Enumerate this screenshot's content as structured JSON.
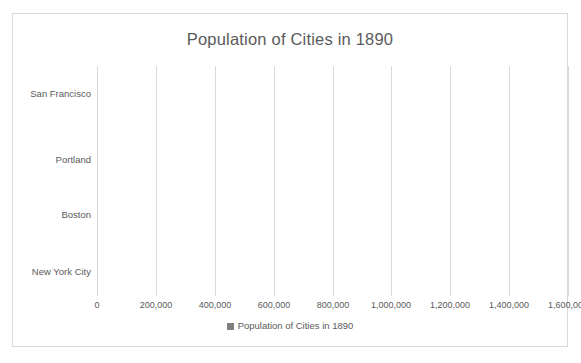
{
  "page": {
    "scan_artifact_text": "​"
  },
  "chart": {
    "title": "Population of Cities in 1890",
    "legend_label": "Population of Cities in 1890",
    "legend_swatch_name": "legend-color-swatch",
    "bar_color": "#808080",
    "gridline_color": "#d9d9d9",
    "text_color": "#5a5a5a",
    "frame_color": "#d9d9d9"
  },
  "chart_data": {
    "type": "bar",
    "orientation": "horizontal",
    "title": "Population of Cities in 1890",
    "xlabel": "",
    "ylabel": "",
    "categories": [
      "San Francisco",
      "Portland",
      "Boston",
      "New York City"
    ],
    "values": [
      300000,
      60000,
      440000,
      1500000
    ],
    "series": [
      {
        "name": "Population of Cities in 1890",
        "values": [
          300000,
          60000,
          440000,
          1500000
        ],
        "color": "#808080"
      }
    ],
    "xlim": [
      0,
      1600000
    ],
    "xticks": [
      0,
      200000,
      400000,
      600000,
      800000,
      1000000,
      1200000,
      1400000,
      1600000
    ],
    "xtick_labels": [
      "0",
      "200,000",
      "400,000",
      "600,000",
      "800,000",
      "1,000,000",
      "1,200,000",
      "1,400,000",
      "1,600,000"
    ],
    "grid": "vertical",
    "legend": "bottom",
    "legend_entries": [
      "Population of Cities in 1890"
    ]
  }
}
